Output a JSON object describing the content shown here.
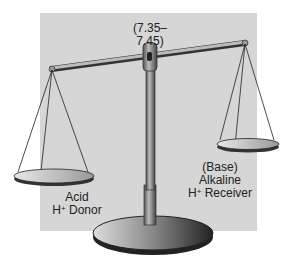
{
  "diagram": {
    "title_range": "(7.35–7.45)",
    "left_pan": {
      "line1": "Acid",
      "line2_prefix": "H",
      "line2_sup": "+",
      "line2_suffix": " Donor"
    },
    "right_pan": {
      "line1": "(Base)",
      "line2": "Alkaline",
      "line3_prefix": "H",
      "line3_sup": "+",
      "line3_suffix": " Receiver"
    },
    "colors": {
      "background_panel": "#d6d6d6",
      "ink": "#222222"
    }
  }
}
